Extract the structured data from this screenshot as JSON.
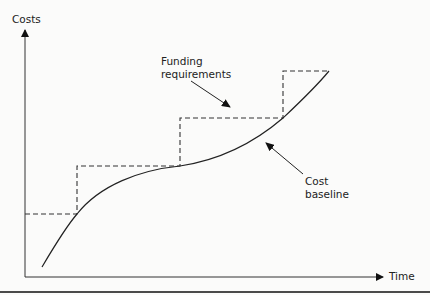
{
  "diagram": {
    "axes": {
      "y_label": "Costs",
      "x_label": "Time"
    },
    "annotations": {
      "funding": {
        "line1": "Funding",
        "line2": "requirements"
      },
      "baseline": {
        "line1": "Cost",
        "line2": "baseline"
      }
    },
    "series": [
      {
        "name": "Funding requirements",
        "style": "dashed-step",
        "points": [
          [
            25,
            214
          ],
          [
            77,
            214
          ],
          [
            77,
            166
          ],
          [
            180,
            166
          ],
          [
            180,
            118
          ],
          [
            283,
            118
          ],
          [
            283,
            71
          ],
          [
            329,
            71
          ]
        ]
      },
      {
        "name": "Cost baseline",
        "style": "solid-s-curve",
        "points": [
          [
            42,
            267
          ],
          [
            77,
            214
          ],
          [
            180,
            166
          ],
          [
            283,
            118
          ],
          [
            329,
            71
          ]
        ]
      }
    ],
    "colors": {
      "line": "#222222",
      "dashed": "#333333",
      "background": "#fbfbfa"
    }
  }
}
